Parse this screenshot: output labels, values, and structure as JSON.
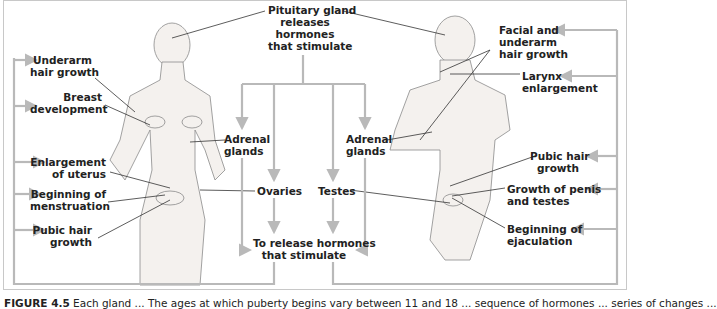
{
  "figure": {
    "center": {
      "pituitary": [
        "Pituitary gland",
        "releases",
        "hormones",
        "that stimulate"
      ],
      "adrenal_left": [
        "Adrenal",
        "glands"
      ],
      "adrenal_right": [
        "Adrenal",
        "glands"
      ],
      "ovaries": "Ovaries",
      "testes": "Testes",
      "release": [
        "To release hormones",
        "that stimulate"
      ]
    },
    "female_labels": [
      [
        "Underarm",
        "hair growth"
      ],
      [
        "Breast",
        "development"
      ],
      [
        "Enlargement",
        "of uterus"
      ],
      [
        "Beginning of",
        "menstruation"
      ],
      [
        "Pubic hair",
        "growth"
      ]
    ],
    "male_labels": [
      [
        "Facial and",
        "underarm",
        "hair growth"
      ],
      [
        "Larynx",
        "enlargement"
      ],
      [
        "Pubic hair",
        "growth"
      ],
      [
        "Growth of penis",
        "and testes"
      ],
      [
        "Beginning of",
        "ejaculation"
      ]
    ],
    "colors": {
      "arrow": "#b9b9b9",
      "leader": "#333333",
      "text": "#222222",
      "figure_fill": "#f3f1ee",
      "figure_stroke": "#8a8a8a"
    }
  },
  "caption": {
    "label": "FIGURE 4.5",
    "text": "Each gland ... The ages at which puberty begins vary between 11 and 18 ... sequence of hormones ... series of changes ..."
  }
}
